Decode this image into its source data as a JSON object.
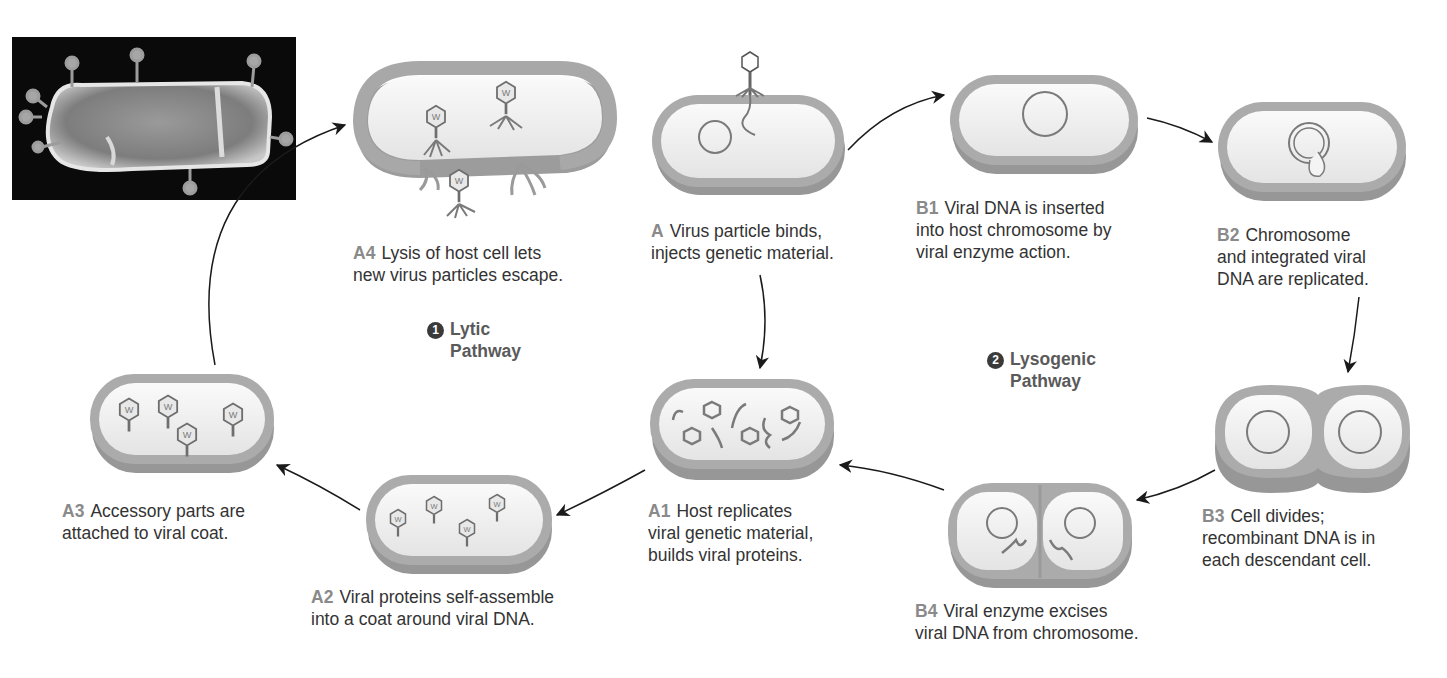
{
  "figure": {
    "colors": {
      "background": "#ffffff",
      "cell_wall": "#a8a8a8",
      "cell_wall_shadow": "#8e8e8e",
      "cytoplasm": "#f1f1f1",
      "dna": "#7a7a7a",
      "arrow": "#1a1a1a",
      "step_tag": "#8a8a8a",
      "body_text": "#333333",
      "photo_bg": "#0a0a0a"
    },
    "photo": {
      "description": "Electron micrograph of bacterium with attached phage particles"
    }
  },
  "pathways": [
    {
      "number": "1",
      "icon": "circled-number-1",
      "line1": "Lytic",
      "line2": "Pathway"
    },
    {
      "number": "2",
      "icon": "circled-number-2",
      "line1": "Lysogenic",
      "line2": "Pathway"
    }
  ],
  "steps": {
    "A": {
      "tag": "A",
      "lines": [
        "Virus particle binds,",
        "injects genetic material."
      ]
    },
    "A1": {
      "tag": "A1",
      "lines": [
        "Host replicates",
        "viral genetic material,",
        "builds viral proteins."
      ]
    },
    "A2": {
      "tag": "A2",
      "lines": [
        "Viral proteins self-assemble",
        "into a coat around viral DNA."
      ]
    },
    "A3": {
      "tag": "A3",
      "lines": [
        "Accessory parts are",
        "attached to viral coat."
      ]
    },
    "A4": {
      "tag": "A4",
      "lines": [
        "Lysis of host cell lets",
        "new virus particles escape."
      ]
    },
    "B1": {
      "tag": "B1",
      "lines": [
        "Viral DNA is inserted",
        "into host chromosome by",
        "viral enzyme action."
      ]
    },
    "B2": {
      "tag": "B2",
      "lines": [
        "Chromosome",
        "and integrated viral",
        "DNA are replicated."
      ]
    },
    "B3": {
      "tag": "B3",
      "lines": [
        "Cell divides;",
        "recombinant DNA is in",
        "each descendant cell."
      ]
    },
    "B4": {
      "tag": "B4",
      "lines": [
        "Viral enzyme excises",
        "viral DNA from chromosome."
      ]
    }
  },
  "flow": [
    [
      "A",
      "A1"
    ],
    [
      "A1",
      "A2"
    ],
    [
      "A2",
      "A3"
    ],
    [
      "A3",
      "A4"
    ],
    [
      "A",
      "B1"
    ],
    [
      "B1",
      "B2"
    ],
    [
      "B2",
      "B3"
    ],
    [
      "B3",
      "B4"
    ],
    [
      "B4",
      "A1"
    ]
  ]
}
